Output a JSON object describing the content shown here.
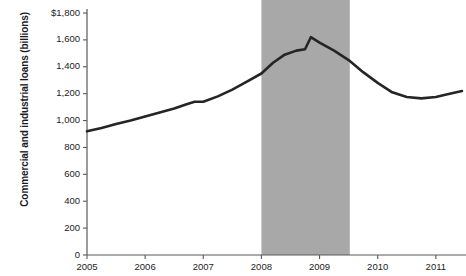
{
  "chart_data": {
    "type": "line",
    "title": "",
    "xlabel": "",
    "ylabel": "Commercial and industrial loans (billions)",
    "ylim": [
      0,
      1800
    ],
    "xlim": [
      2005,
      2011.45
    ],
    "grid": false,
    "legend": null,
    "yticks": [
      0,
      200,
      400,
      600,
      800,
      1000,
      1200,
      1400,
      1600,
      1800
    ],
    "ytick_labels": [
      "0",
      "200",
      "400",
      "600",
      "800",
      "1,000",
      "1,200",
      "1,400",
      "1,600",
      "$1,800"
    ],
    "xticks": [
      2005,
      2006,
      2007,
      2008,
      2009,
      2010,
      2011
    ],
    "xtick_labels": [
      "2005",
      "2006",
      "2007",
      "2008",
      "2009",
      "2010",
      "2011"
    ],
    "series": [
      {
        "name": "Commercial and industrial loans",
        "color": "#252525",
        "x": [
          2005.0,
          2005.25,
          2005.5,
          2005.75,
          2006.0,
          2006.25,
          2006.5,
          2006.7,
          2006.85,
          2007.0,
          2007.25,
          2007.5,
          2007.75,
          2008.0,
          2008.2,
          2008.4,
          2008.6,
          2008.75,
          2008.85,
          2009.0,
          2009.25,
          2009.5,
          2009.75,
          2010.0,
          2010.25,
          2010.5,
          2010.75,
          2011.0,
          2011.2,
          2011.45
        ],
        "values": [
          920,
          945,
          975,
          1000,
          1030,
          1060,
          1090,
          1120,
          1140,
          1140,
          1180,
          1230,
          1290,
          1350,
          1430,
          1490,
          1520,
          1530,
          1620,
          1580,
          1520,
          1450,
          1360,
          1280,
          1210,
          1175,
          1165,
          1175,
          1195,
          1220
        ]
      }
    ],
    "shaded_regions": [
      {
        "name": "recession-band",
        "x_start": 2008.0,
        "x_end": 2009.52,
        "color": "#a8a8a8",
        "label": ""
      }
    ]
  },
  "axis": {
    "y_title": "Commercial and industrial loans (billions)",
    "axis_color": "#5a5a5a"
  }
}
